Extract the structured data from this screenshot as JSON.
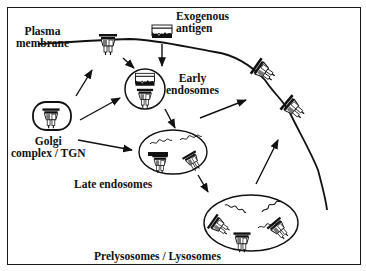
{
  "figure": {
    "type": "schematic",
    "colors": {
      "ink": "#111111",
      "background": "#ffffff",
      "fill_grey": "#8a8a8a",
      "fill_dark": "#333333"
    }
  },
  "labels": {
    "plasma_membrane_1": "Plasma",
    "plasma_membrane_2": "membrane",
    "exogenous_antigen_1": "Exogenous",
    "exogenous_antigen_2": "antigen",
    "early_endosomes_1": "Early",
    "early_endosomes_2": "endosomes",
    "golgi_1": "Golgi",
    "golgi_2": "complex / TGN",
    "late_endosomes": "Late endosomes",
    "prelysosomes": "Prelysosomes / Lysosomes"
  },
  "compartments": [
    {
      "name": "Golgi complex / TGN",
      "shape": "rounded-rect"
    },
    {
      "name": "Early endosomes",
      "shape": "circle"
    },
    {
      "name": "Late endosomes",
      "shape": "ellipse"
    },
    {
      "name": "Prelysosomes / Lysosomes",
      "shape": "ellipse"
    },
    {
      "name": "Plasma membrane",
      "shape": "line"
    }
  ],
  "arrows": [
    {
      "from": "Golgi complex / TGN",
      "to": "Plasma membrane"
    },
    {
      "from": "Golgi complex / TGN",
      "to": "Early endosomes"
    },
    {
      "from": "Golgi complex / TGN",
      "to": "Late endosomes"
    },
    {
      "from": "Plasma membrane",
      "to": "Early endosomes"
    },
    {
      "from": "Exogenous antigen",
      "to": "Early endosomes"
    },
    {
      "from": "Early endosomes",
      "to": "Late endosomes"
    },
    {
      "from": "Late endosomes",
      "to": "Prelysosomes / Lysosomes"
    },
    {
      "from": "Late endosomes",
      "to": "Plasma membrane"
    },
    {
      "from": "Prelysosomes / Lysosomes",
      "to": "Plasma membrane"
    }
  ]
}
